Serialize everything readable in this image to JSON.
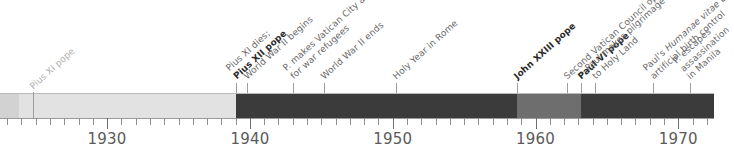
{
  "chart_data": {
    "type": "timeline",
    "title": "",
    "xlabel": "",
    "ylabel": "",
    "axis": {
      "start_year": 1922.5,
      "end_year": 1972.5,
      "tick_interval": 1,
      "major_tick_interval": 10,
      "tick_labels": [
        "1930",
        "1940",
        "1950",
        "1960",
        "1970"
      ],
      "tick_label_years": [
        1930,
        1940,
        1950,
        1960,
        1970
      ],
      "grid": false,
      "legend": "none"
    },
    "eras": [
      {
        "name": "pre-period",
        "start_year": 1922.5,
        "end_year": 1923.8,
        "color": "#d2d2d2"
      },
      {
        "name": "Pius XI",
        "start_year": 1923.8,
        "end_year": 1939.0,
        "color": "#e2e2e2"
      },
      {
        "name": "Pius XII",
        "start_year": 1939.0,
        "end_year": 1958.7,
        "color": "#3b3b3b"
      },
      {
        "name": "John XXIII",
        "start_year": 1958.7,
        "end_year": 1963.2,
        "color": "#6e6e6e"
      },
      {
        "name": "Paul VI",
        "start_year": 1963.2,
        "end_year": 1972.5,
        "color": "#3b3b3b"
      }
    ],
    "events": [
      {
        "year": 1924.8,
        "lines": [
          "Pius XI pope"
        ],
        "bold_lines": [],
        "style": "faint"
      },
      {
        "year": 1939.0,
        "lines": [
          "Pius XI dies;",
          "Pius XII pope"
        ],
        "bold_lines": [
          1
        ],
        "style": "normal"
      },
      {
        "year": 1939.8,
        "lines": [
          "World War II begins"
        ],
        "bold_lines": [],
        "style": "normal"
      },
      {
        "year": 1943.0,
        "lines": [
          "P. makes Vatican City asylum",
          "for war refugees"
        ],
        "bold_lines": [],
        "style": "normal"
      },
      {
        "year": 1945.2,
        "lines": [
          "World War II ends"
        ],
        "bold_lines": [],
        "style": "normal"
      },
      {
        "year": 1950.2,
        "lines": [
          "Holy Year in Rome"
        ],
        "bold_lines": [],
        "style": "normal"
      },
      {
        "year": 1958.7,
        "lines": [
          "John XXIII pope"
        ],
        "bold_lines": [
          0
        ],
        "style": "normal"
      },
      {
        "year": 1962.2,
        "lines": [
          "Second Vatican Council opens"
        ],
        "bold_lines": [],
        "style": "normal"
      },
      {
        "year": 1963.2,
        "lines": [
          "Paul VI pope"
        ],
        "bold_lines": [
          0
        ],
        "style": "normal"
      },
      {
        "year": 1964.2,
        "lines": [
          "Paul makes pilgrimage",
          "to Holy Land"
        ],
        "bold_lines": [],
        "style": "normal"
      },
      {
        "year": 1968.2,
        "lines": [
          "Paul's Humanae vitae bans",
          "artificial birth control"
        ],
        "bold_lines": [],
        "italic_spans": [
          "Humanae vitae"
        ],
        "style": "normal"
      },
      {
        "year": 1970.8,
        "lines": [
          "P. escapes",
          "assassination",
          "in Manila"
        ],
        "bold_lines": [],
        "style": "normal"
      }
    ]
  },
  "timeline": {
    "name": "papal-history-timeline",
    "colors": {
      "band_light": "#e2e2e2",
      "band_pre": "#d2d2d2",
      "band_dark": "#3b3b3b",
      "band_medium": "#6e6e6e",
      "axis": "#9a9a9a",
      "tick": "#8d8d8d",
      "text": "#6a6a6a",
      "text_bold": "#2b2b2b",
      "background": "#ffffff"
    }
  }
}
